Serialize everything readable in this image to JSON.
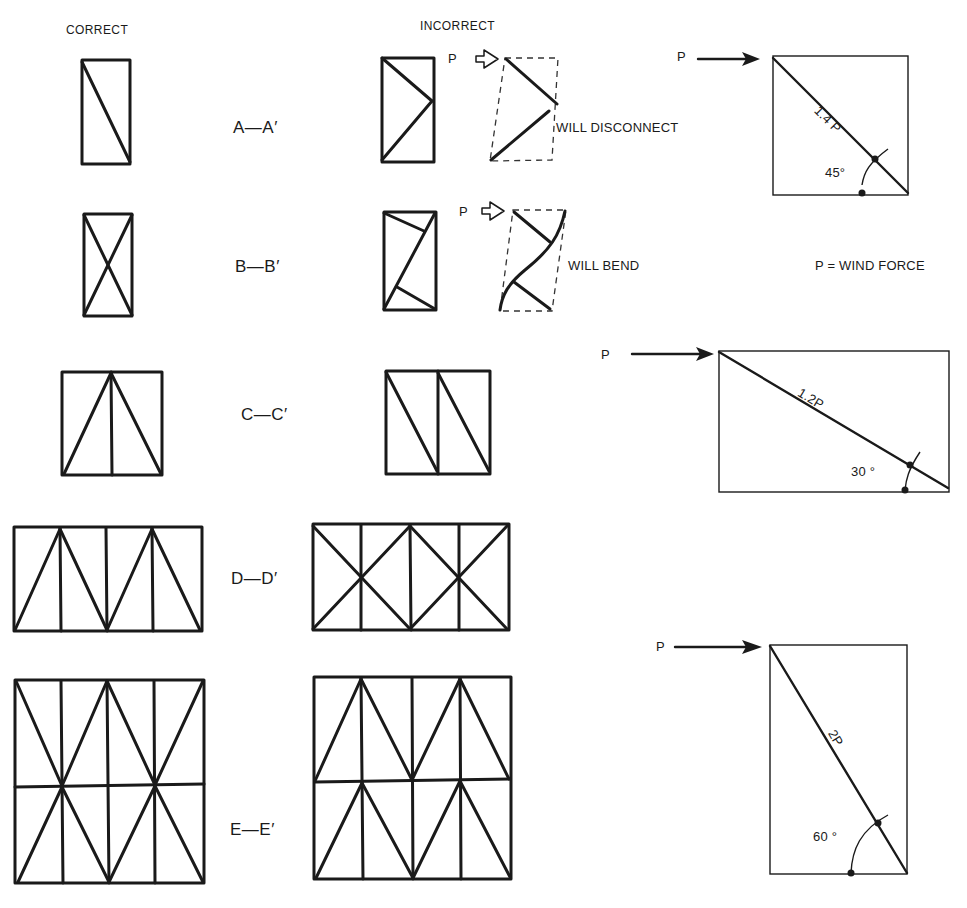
{
  "headers": {
    "correct": "CORRECT",
    "incorrect": "INCORRECT"
  },
  "sections": [
    {
      "id": "A",
      "label": "A—A′",
      "note": "WILL DISCONNECT",
      "force_label": "P"
    },
    {
      "id": "B",
      "label": "B—B′",
      "note": "WILL BEND",
      "force_label": "P"
    },
    {
      "id": "C",
      "label": "C—C′"
    },
    {
      "id": "D",
      "label": "D—D′"
    },
    {
      "id": "E",
      "label": "E—E′"
    }
  ],
  "legend": {
    "wind_force": "P = WIND FORCE"
  },
  "force_diagrams": [
    {
      "force_label": "P",
      "member_force": "1.4 P",
      "angle": "45°"
    },
    {
      "force_label": "P",
      "member_force": "1.2P",
      "angle": "30 °"
    },
    {
      "force_label": "P",
      "member_force": "2P",
      "angle": "60 °"
    }
  ]
}
